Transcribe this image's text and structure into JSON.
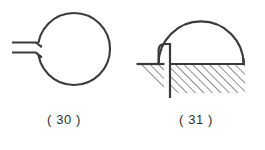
{
  "plate": {
    "background_color": "#ffffff",
    "ink_color": "#3a3a3a",
    "hatch_color": "#3a3a3a",
    "width": 265,
    "height": 150
  },
  "figures": [
    {
      "id": "figure-30",
      "caption": "( 30 )",
      "number": "30",
      "description": "circle with two parallel horizontal lead lines entering from the left",
      "parts": [
        {
          "name": "circle-outline",
          "shape": "circle",
          "cx": 74,
          "cy": 49,
          "r": 36
        },
        {
          "name": "upper-lead-line",
          "shape": "line",
          "x1": 12,
          "y1": 43,
          "x2": 41,
          "y2": 43
        },
        {
          "name": "lower-lead-line",
          "shape": "line",
          "x1": 12,
          "y1": 52,
          "x2": 41,
          "y2": 52
        }
      ]
    },
    {
      "id": "figure-31",
      "caption": "( 31 )",
      "number": "31",
      "description": "semicircular dome over a hatched ground region with a vertical post and a separate small hatched ground wedge at left",
      "parts": [
        {
          "name": "dome-arc",
          "shape": "arc",
          "cx": 200,
          "cy": 64,
          "r": 42
        },
        {
          "name": "vertical-post",
          "shape": "line",
          "x1": 170,
          "y1": 46,
          "x2": 170,
          "y2": 98
        },
        {
          "name": "ground-line-main",
          "shape": "line",
          "x1": 170,
          "y1": 64,
          "x2": 244,
          "y2": 64
        },
        {
          "name": "ground-line-left",
          "shape": "line",
          "x1": 137,
          "y1": 64,
          "x2": 164,
          "y2": 64
        },
        {
          "name": "right-end-tick",
          "shape": "line",
          "x1": 244,
          "y1": 60,
          "x2": 244,
          "y2": 67
        },
        {
          "name": "hatch-region-main",
          "shape": "rect",
          "x": 170,
          "y": 64,
          "width": 74,
          "height": 28
        },
        {
          "name": "hatch-region-left",
          "shape": "triangle",
          "points": "137,64 164,64 164,90"
        }
      ]
    }
  ]
}
